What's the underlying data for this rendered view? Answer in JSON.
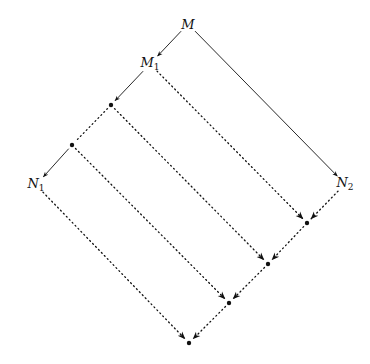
{
  "diagram": {
    "nodes": [
      {
        "id": "M",
        "label": "M",
        "sub": "",
        "x": 188,
        "y": 24
      },
      {
        "id": "M1",
        "label": "M",
        "sub": "1",
        "x": 150,
        "y": 64
      },
      {
        "id": "A1",
        "label": "",
        "sub": "",
        "x": 111,
        "y": 105,
        "dot": true
      },
      {
        "id": "A2",
        "label": "",
        "sub": "",
        "x": 72,
        "y": 145,
        "dot": true
      },
      {
        "id": "N1",
        "label": "N",
        "sub": "1",
        "x": 36,
        "y": 185
      },
      {
        "id": "N2",
        "label": "N",
        "sub": "2",
        "x": 345,
        "y": 184
      },
      {
        "id": "B1",
        "label": "",
        "sub": "",
        "x": 307,
        "y": 223,
        "dot": true
      },
      {
        "id": "B2",
        "label": "",
        "sub": "",
        "x": 268,
        "y": 264,
        "dot": true
      },
      {
        "id": "B3",
        "label": "",
        "sub": "",
        "x": 229,
        "y": 303,
        "dot": true
      },
      {
        "id": "B4",
        "label": "",
        "sub": "",
        "x": 189,
        "y": 343,
        "dot": true
      }
    ],
    "edges": [
      {
        "from": "M",
        "to": "M1",
        "style": "solid",
        "arrow": true
      },
      {
        "from": "M",
        "to": "N2",
        "style": "solid",
        "arrow": true
      },
      {
        "from": "M1",
        "to": "A1",
        "style": "solid",
        "arrow": true
      },
      {
        "from": "A1",
        "to": "A2",
        "style": "dotted",
        "arrow": false
      },
      {
        "from": "A2",
        "to": "N1",
        "style": "solid",
        "arrow": true
      },
      {
        "from": "M1",
        "to": "B1",
        "style": "dotted",
        "arrow": true
      },
      {
        "from": "A1",
        "to": "B2",
        "style": "dotted",
        "arrow": true
      },
      {
        "from": "A2",
        "to": "B3",
        "style": "dotted",
        "arrow": true
      },
      {
        "from": "N1",
        "to": "B4",
        "style": "dotted",
        "arrow": true
      },
      {
        "from": "N2",
        "to": "B1",
        "style": "dotted",
        "arrow": true
      },
      {
        "from": "B1",
        "to": "B2",
        "style": "dotted",
        "arrow": true
      },
      {
        "from": "B2",
        "to": "B3",
        "style": "dotted",
        "arrow": true
      },
      {
        "from": "B3",
        "to": "B4",
        "style": "dotted",
        "arrow": true
      }
    ]
  }
}
